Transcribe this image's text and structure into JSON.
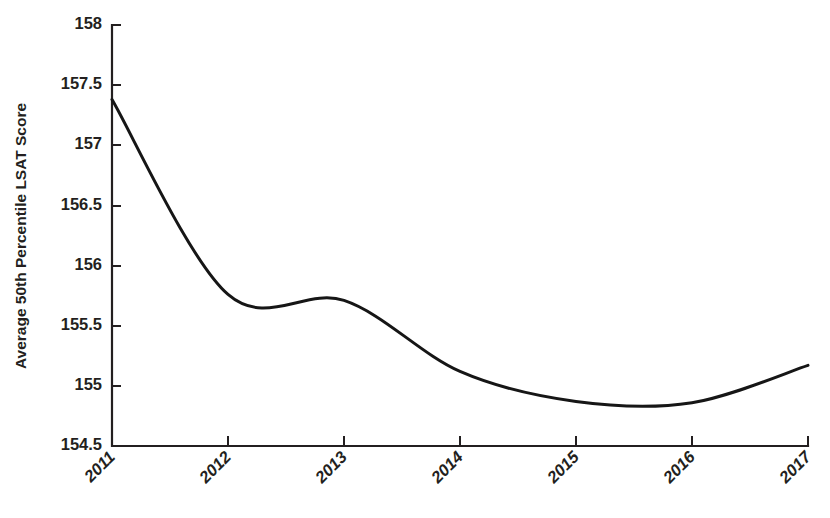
{
  "chart_data": {
    "type": "line",
    "title": "",
    "subtitle": "",
    "xlabel": "",
    "ylabel": "Average 50th Percentile LSAT Score",
    "x": [
      2011,
      2012,
      2013,
      2014,
      2015,
      2016,
      2017
    ],
    "categories": [
      "2011",
      "2012",
      "2013",
      "2014",
      "2015",
      "2016",
      "2017"
    ],
    "values": [
      157.38,
      155.76,
      155.71,
      155.12,
      154.87,
      154.86,
      155.17
    ],
    "series": [
      {
        "name": "Average 50th Percentile LSAT Score",
        "values": [
          157.38,
          155.76,
          155.71,
          155.12,
          154.87,
          154.86,
          155.17
        ]
      }
    ],
    "xlim": [
      2011,
      2017
    ],
    "ylim": [
      154.5,
      158
    ],
    "xticks": [
      2011,
      2012,
      2013,
      2014,
      2015,
      2016,
      2017
    ],
    "yticks": [
      154.5,
      155,
      155.5,
      156,
      156.5,
      157,
      157.5,
      158
    ],
    "ytick_labels": [
      "154.5",
      "155",
      "155.5",
      "156",
      "156.5",
      "157",
      "157.5",
      "158"
    ],
    "xtick_labels": [
      "2011",
      "2012",
      "2013",
      "2014",
      "2015",
      "2016",
      "2017"
    ],
    "xtick_rotation_deg": 45,
    "grid": false,
    "legend": false,
    "legend_position": "none",
    "annotations": [],
    "line_color": "#161616",
    "axis_color": "#231f20",
    "background_color": "#ffffff",
    "minimum_point": {
      "x": 2015.6,
      "y": 154.84
    }
  },
  "axis": {
    "y_tick_labels": [
      {
        "value": "158"
      },
      {
        "value": "157.5"
      },
      {
        "value": "157"
      },
      {
        "value": "156.5"
      },
      {
        "value": "156"
      },
      {
        "value": "155.5"
      },
      {
        "value": "155"
      },
      {
        "value": "154.5"
      }
    ],
    "x_tick_labels": [
      {
        "value": "2011"
      },
      {
        "value": "2012"
      },
      {
        "value": "2013"
      },
      {
        "value": "2014"
      },
      {
        "value": "2015"
      },
      {
        "value": "2016"
      },
      {
        "value": "2017"
      }
    ],
    "y_axis_title": "Average 50th Percentile LSAT Score"
  }
}
